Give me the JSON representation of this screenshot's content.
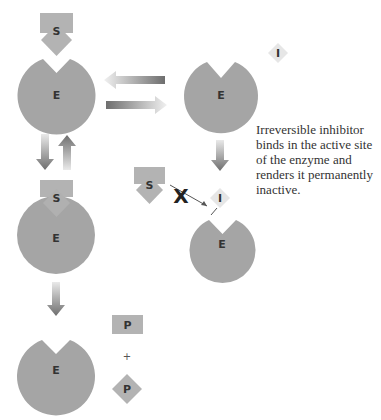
{
  "diagram": {
    "colors": {
      "enzyme": "#a5a5a5",
      "substrate": "#b3b3b3",
      "inhibitor": "#e6e6e6",
      "arrow": "#7d7d7d",
      "text": "#333333"
    },
    "labels": {
      "substrate": "S",
      "enzyme": "E",
      "inhibitor": "I",
      "product": "P",
      "plus": "+"
    },
    "caption": "Irreversible inhibitor binds in the active site of the enzyme and renders it permanently inactive.",
    "blocked_marker": "X"
  }
}
